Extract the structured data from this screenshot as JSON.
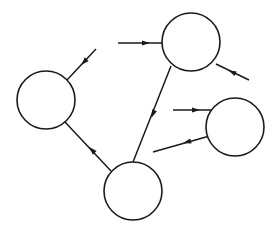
{
  "diagram": {
    "type": "directed-graph",
    "width": 276,
    "height": 232,
    "colors": {
      "stroke": "#1a1a1a",
      "fill": "#ffffff",
      "background": "#ffffff"
    },
    "nodes": [
      {
        "id": "left",
        "cx": 46,
        "cy": 100,
        "r": 29,
        "label": ""
      },
      {
        "id": "top-right",
        "cx": 191,
        "cy": 42,
        "r": 29,
        "label": ""
      },
      {
        "id": "right",
        "cx": 235,
        "cy": 127,
        "r": 29,
        "label": ""
      },
      {
        "id": "bottom",
        "cx": 133,
        "cy": 191,
        "r": 29,
        "label": ""
      }
    ],
    "edges": [
      {
        "id": "in-left",
        "from": null,
        "to": "left",
        "x1": 96,
        "y1": 49,
        "x2": 67,
        "y2": 80,
        "ax": 84,
        "ay": 62
      },
      {
        "id": "in-top-right-a",
        "from": null,
        "to": "top-right",
        "x1": 118,
        "y1": 43,
        "x2": 162,
        "y2": 43,
        "ax": 146,
        "ay": 43
      },
      {
        "id": "in-top-right-b",
        "from": null,
        "to": "top-right",
        "x1": 249,
        "y1": 80,
        "x2": 216,
        "y2": 64,
        "ax": 232,
        "ay": 72
      },
      {
        "id": "in-right",
        "from": null,
        "to": "right",
        "x1": 173,
        "y1": 110,
        "x2": 212,
        "y2": 110,
        "ax": 196,
        "ay": 110
      },
      {
        "id": "top-right-bottom",
        "from": "top-right",
        "to": "bottom",
        "x1": 171,
        "y1": 66,
        "x2": 133,
        "y2": 162,
        "ax": 153,
        "ay": 114
      },
      {
        "id": "right-bottom",
        "from": "right",
        "to": "bottom",
        "x1": 213,
        "y1": 135,
        "x2": 153,
        "y2": 152,
        "ax": 187,
        "ay": 142
      },
      {
        "id": "bottom-left",
        "from": "bottom",
        "to": "left",
        "x1": 111,
        "y1": 171,
        "x2": 65,
        "y2": 122,
        "ax": 92,
        "ay": 150
      }
    ]
  }
}
